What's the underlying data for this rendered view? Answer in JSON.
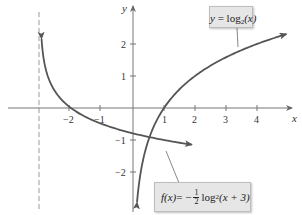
{
  "chart_data": {
    "type": "line",
    "title": "",
    "xlabel": "x",
    "ylabel": "y",
    "xlim": [
      -3.6,
      5.2
    ],
    "ylim": [
      -3.0,
      3.4
    ],
    "grid": false,
    "x_ticks": [
      -2,
      -1,
      1,
      2,
      3,
      4
    ],
    "y_ticks": [
      -2,
      -1,
      1,
      2
    ],
    "x_tick_labels": [
      "−2",
      "−1",
      "1",
      "2",
      "3",
      "4"
    ],
    "y_tick_labels": [
      "−2",
      "−1",
      "1",
      "2"
    ],
    "asymptotes": [
      {
        "type": "vertical",
        "x": -3,
        "style": "dashed"
      }
    ],
    "series": [
      {
        "name": "y = log2(x)",
        "expression": "log2(x)",
        "domain": [
          0.13,
          4.95
        ],
        "x": [
          0.13,
          0.25,
          0.5,
          1,
          2,
          3,
          4,
          4.95
        ],
        "values": [
          -2.94,
          -2,
          -1,
          0,
          1,
          1.58,
          2,
          2.31
        ],
        "color": "#555555"
      },
      {
        "name": "f(x) = -1/2 log2(x + 3)",
        "expression": "-0.5*log2(x+3)",
        "domain": [
          -2.95,
          1.9
        ],
        "x": [
          -2.95,
          -2.875,
          -2.5,
          -2,
          -1,
          0,
          1,
          1.9
        ],
        "values": [
          2.16,
          1.5,
          0.5,
          0,
          -0.5,
          -0.79,
          -1,
          -1.15
        ],
        "color": "#555555"
      }
    ],
    "annotations": [
      {
        "text": "y = log₂(x)",
        "target_series": 0
      },
      {
        "text": "f(x) = −½ log₂(x + 3)",
        "target_series": 1
      }
    ]
  },
  "labels": {
    "x_axis": "x",
    "y_axis": "y",
    "ticks_x": [
      "−2",
      "−1",
      "1",
      "2",
      "3",
      "4"
    ],
    "ticks_y": [
      "2",
      "1",
      "−1",
      "−2"
    ],
    "callout_top": {
      "lhs": "y",
      "eq": " = log",
      "sub": "2",
      "arg": "(x)"
    },
    "callout_bottom": {
      "lhs": "f(x)",
      "eq": " = −",
      "frac_num": "1",
      "frac_den": "2",
      "log": "log",
      "sub": "2",
      "arg": "(x + 3)"
    }
  },
  "colors": {
    "curve": "#555555",
    "axis": "#777777",
    "asymptote": "#999999",
    "callout_bg": "#e6e6e6"
  }
}
